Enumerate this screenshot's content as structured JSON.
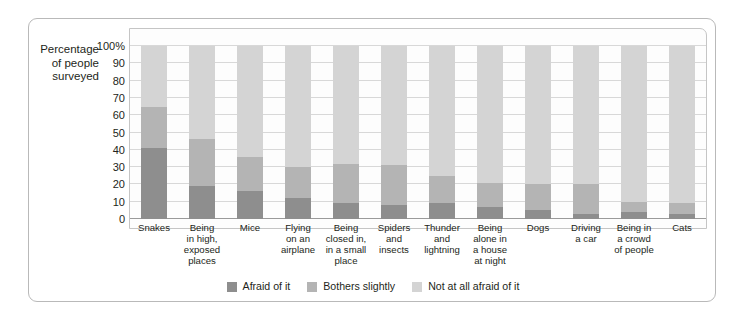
{
  "axis_title": {
    "line1": "Percentage",
    "line2": "of people",
    "line3": "surveyed"
  },
  "chart_data": {
    "type": "bar",
    "subtype": "stacked-column-100",
    "title": "",
    "xlabel": "",
    "ylabel": "Percentage of people surveyed",
    "ylim": [
      0,
      100
    ],
    "yticks": [
      "0",
      "10",
      "20",
      "30",
      "40",
      "50",
      "60",
      "70",
      "80",
      "90",
      "100%"
    ],
    "ytick_values": [
      0,
      10,
      20,
      30,
      40,
      50,
      60,
      70,
      80,
      90,
      100
    ],
    "grid": true,
    "legend_position": "bottom-center",
    "categories": [
      "Snakes",
      "Being in high, exposed places",
      "Mice",
      "Flying on an airplane",
      "Being closed in, in a small place",
      "Spiders and insects",
      "Thunder and lightning",
      "Being alone in a house at night",
      "Dogs",
      "Driving a car",
      "Being in a crowd of people",
      "Cats"
    ],
    "category_lines": [
      [
        "Snakes"
      ],
      [
        "Being",
        "in high,",
        "exposed",
        "places"
      ],
      [
        "Mice"
      ],
      [
        "Flying",
        "on an",
        "airplane"
      ],
      [
        "Being",
        "closed in,",
        "in a small",
        "place"
      ],
      [
        "Spiders",
        "and",
        "insects"
      ],
      [
        "Thunder",
        "and",
        "lightning"
      ],
      [
        "Being",
        "alone in",
        "a house",
        "at night"
      ],
      [
        "Dogs"
      ],
      [
        "Driving",
        "a car"
      ],
      [
        "Being in",
        "a crowd",
        "of people"
      ],
      [
        "Cats"
      ]
    ],
    "series": [
      {
        "name": "Afraid of it",
        "color": "#8e8e8e",
        "values": [
          41,
          19,
          16,
          12,
          9,
          8,
          9,
          7,
          5,
          3,
          4,
          3
        ]
      },
      {
        "name": "Bothers slightly",
        "color": "#b4b4b4",
        "values": [
          24,
          27,
          20,
          18,
          23,
          23,
          16,
          14,
          15,
          17,
          6,
          6
        ]
      },
      {
        "name": "Not at all afraid of it",
        "color": "#d4d4d4",
        "values": [
          35,
          54,
          64,
          70,
          68,
          69,
          75,
          79,
          80,
          80,
          90,
          91
        ]
      }
    ],
    "segment_tops": {
      "afraid_of_it": [
        41,
        19,
        16,
        12,
        9,
        8,
        9,
        7,
        5,
        3,
        4,
        3
      ],
      "cumulative_bothers_slightly": [
        65,
        46,
        36,
        30,
        32,
        31,
        25,
        21,
        20,
        20,
        10,
        9
      ]
    },
    "legend": [
      {
        "label": "Afraid of it",
        "color": "#8e8e8e"
      },
      {
        "label": "Bothers slightly",
        "color": "#b4b4b4"
      },
      {
        "label": "Not at all afraid of it",
        "color": "#d4d4d4"
      }
    ]
  }
}
